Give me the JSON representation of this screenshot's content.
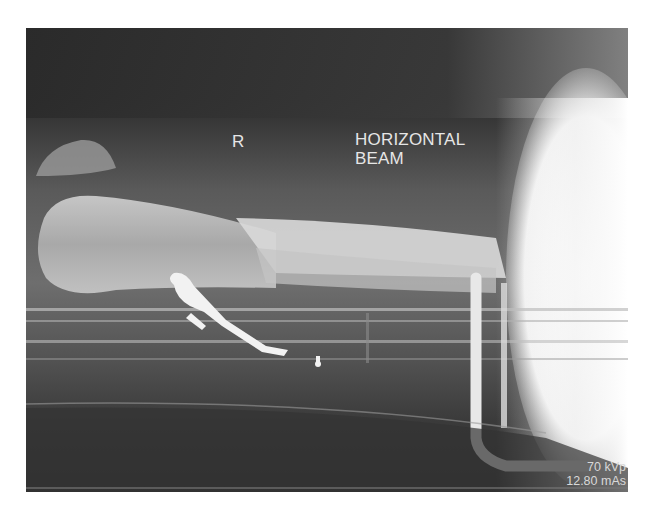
{
  "image": {
    "type": "radiograph",
    "view_description": "lateral humerus, horizontal beam",
    "colors": {
      "background": "#ffffff",
      "film_dark": "#2a2a2a",
      "bone": "#cfcfcf",
      "hardware": "#f2f2f2",
      "annotation_text": "#e6e6e6"
    }
  },
  "annotations": {
    "side_marker": "R",
    "projection_line1": "HORIZONTAL",
    "projection_line2": "BEAM",
    "exposure_kvp": "70 kVp",
    "exposure_mas": "12.80 mAs"
  }
}
